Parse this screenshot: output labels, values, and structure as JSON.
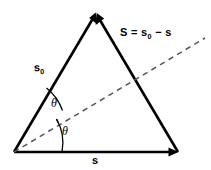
{
  "figure": {
    "type": "vector-triangle-diagram",
    "background_color": "#ffffff",
    "stroke_color": "#000000",
    "dashed_color": "#55555a",
    "labels": {
      "s0": "s",
      "s0_subscript": "0",
      "S_expression_prefix": "S = s",
      "S_expression_subscript": "0",
      "S_expression_suffix": " − s",
      "s_bottom": "s",
      "theta_upper": "θ",
      "theta_lower": "θ"
    },
    "geometry": {
      "vertex_left": [
        14,
        152
      ],
      "vertex_apex": [
        96,
        13
      ],
      "vertex_right": [
        178,
        152
      ],
      "dashed_start": [
        14,
        152
      ],
      "dashed_end": [
        205,
        38
      ]
    }
  }
}
